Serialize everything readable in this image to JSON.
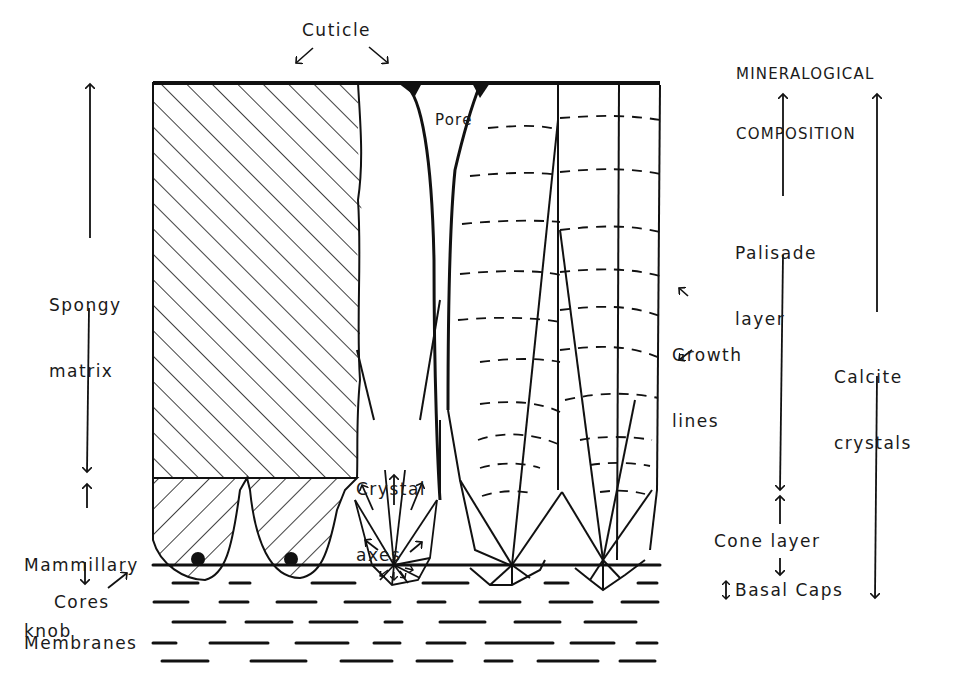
{
  "diagram": {
    "type": "eggshell cross-section schematic",
    "colors": {
      "ink": "#111111",
      "background": "#ffffff"
    },
    "labels": {
      "cuticle": "Cuticle",
      "pore": "Pore",
      "spongy_matrix": [
        "Spongy",
        "matrix"
      ],
      "mammillary_knob": [
        "Mammillary",
        "knob"
      ],
      "cores": "Cores",
      "membranes": "Membranes",
      "crystal_axes": [
        "Crystal",
        "axes"
      ],
      "growth_lines": [
        "Growth",
        "lines"
      ],
      "mineralogical_composition": [
        "MINERALOGICAL",
        "COMPOSITION"
      ],
      "palisade_layer": [
        "Palisade",
        "layer"
      ],
      "cone_layer": "Cone layer",
      "basal_caps": "Basal Caps",
      "calcite_crystals": [
        "Calcite",
        "crystals"
      ]
    },
    "layers_left_axis": [
      {
        "name": "Spongy matrix",
        "from": "cuticle",
        "to": "mammillary boundary"
      },
      {
        "name": "Mammillary knob",
        "from": "mammillary boundary",
        "to": "membrane"
      }
    ],
    "layers_right_axis": [
      {
        "name": "Palisade layer",
        "from": "cuticle",
        "to": "cone boundary"
      },
      {
        "name": "Cone layer",
        "from": "cone boundary",
        "to": "basal caps"
      },
      {
        "name": "Basal Caps",
        "from": "basal caps",
        "to": "membrane"
      },
      {
        "name": "Calcite crystals",
        "from": "cuticle",
        "to": "basal caps"
      }
    ]
  }
}
